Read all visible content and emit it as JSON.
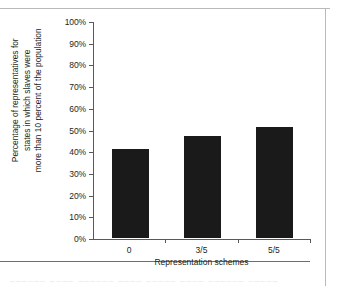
{
  "chart_data": {
    "type": "bar",
    "title": "",
    "subtitle": "",
    "categories": [
      "0",
      "3/5",
      "5/5"
    ],
    "values": [
      41,
      47,
      51
    ],
    "series": [
      {
        "name": "Percentage of representatives",
        "values": [
          41,
          47,
          51
        ]
      }
    ],
    "xlabel": "Representation schemes",
    "ylabel": "Percentage of representatives for states in which slaves were more than 10 percent of the population",
    "ylabel_lines": [
      "Percentage of representatives for",
      "states in which slaves were",
      "more than 10 percent of the population"
    ],
    "ylim": [
      0,
      100
    ],
    "ytick_values": [
      0,
      10,
      20,
      30,
      40,
      50,
      60,
      70,
      80,
      90,
      100
    ],
    "ytick_labels": [
      "0%",
      "10%",
      "20%",
      "30%",
      "40%",
      "50%",
      "60%",
      "70%",
      "80%",
      "90%",
      "100%"
    ],
    "grid": false,
    "legend": false,
    "legend_position": "none",
    "bar_color": "#1a1a1a",
    "axis_color": "#59595b",
    "background": "#ffffff"
  },
  "bleed_text": "______ ____ ______ ____ _____ ____ ______ _____"
}
